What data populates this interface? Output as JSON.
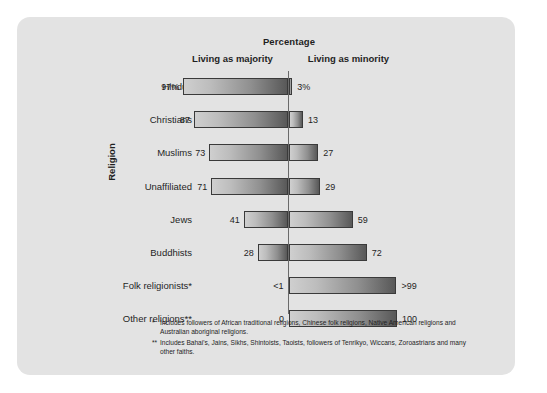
{
  "chart_data": {
    "type": "bar",
    "title": "Percentage",
    "xlabel": "Percentage",
    "ylabel": "Religion",
    "orientation": "horizontal-diverging",
    "grid": false,
    "legend_position": "top",
    "series": [
      {
        "name": "Living as majority",
        "values": [
          97,
          87,
          73,
          71,
          41,
          28,
          0.5,
          0
        ]
      },
      {
        "name": "Living as minority",
        "values": [
          3,
          13,
          27,
          29,
          59,
          72,
          99.5,
          100
        ]
      }
    ],
    "categories": [
      "Hindus",
      "Christians",
      "Muslims",
      "Unaffiliated",
      "Jews",
      "Buddhists",
      "Folk religionists*",
      "Other religions**"
    ],
    "left_labels": [
      "97%",
      "87",
      "73",
      "71",
      "41",
      "28",
      "<1",
      "0"
    ],
    "right_labels": [
      "3%",
      "13",
      "27",
      "29",
      "59",
      "72",
      ">99",
      "100"
    ],
    "xlim": [
      -100,
      100
    ],
    "annotations": [
      "*Includes followers of African traditional religions, Chinese folk religions, Native American religions and Australian aboriginal religions.",
      "**Includes Bahai's, Jains, Sikhs, Shintoists, Taoists, followers of Tenrikyo, Wiccans, Zoroastrians and many other faiths."
    ]
  },
  "headers": {
    "percentage": "Percentage",
    "majority": "Living as majority",
    "minority": "Living as minority",
    "religion_axis": "Religion"
  },
  "rows": [
    {
      "category": "Hindus",
      "left_value": "97%",
      "right_value": "3%",
      "left_pct": 97,
      "right_pct": 3
    },
    {
      "category": "Christians",
      "left_value": "87",
      "right_value": "13",
      "left_pct": 87,
      "right_pct": 13
    },
    {
      "category": "Muslims",
      "left_value": "73",
      "right_value": "27",
      "left_pct": 73,
      "right_pct": 27
    },
    {
      "category": "Unaffiliated",
      "left_value": "71",
      "right_value": "29",
      "left_pct": 71,
      "right_pct": 29
    },
    {
      "category": "Jews",
      "left_value": "41",
      "right_value": "59",
      "left_pct": 41,
      "right_pct": 59
    },
    {
      "category": "Buddhists",
      "left_value": "28",
      "right_value": "72",
      "left_pct": 28,
      "right_pct": 72
    },
    {
      "category": "Folk religionists*",
      "left_value": "<1",
      "right_value": ">99",
      "left_pct": 0.5,
      "right_pct": 99.5
    },
    {
      "category": "Other religions**",
      "left_value": "0",
      "right_value": "100",
      "left_pct": 0,
      "right_pct": 100
    }
  ],
  "footnotes": [
    {
      "mark": "*",
      "text": "Includes followers of African traditional religions, Chinese folk religions, Native American religions and Australian aboriginal religions."
    },
    {
      "mark": "**",
      "text": "Includes Bahai's, Jains, Sikhs, Shintoists, Taoists, followers of Tenrikyo, Wiccans, Zoroastrians and many other faiths."
    }
  ],
  "colors": {
    "panel_background": "#e3e3e3",
    "page_background": "#ffffff",
    "bar_light": "#cfcfcf",
    "bar_dark": "#585858",
    "bar_border": "#3a3a3a",
    "axis_line": "#6a6a6a",
    "text": "#1f1f1f"
  }
}
